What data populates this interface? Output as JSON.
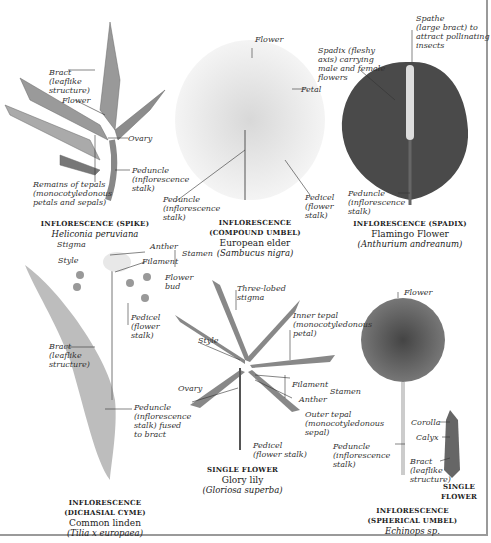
{
  "figure": {
    "panels": [
      {
        "id": "spike",
        "caption": {
          "type": "INFLORESCENCE (SPIKE)",
          "common": "",
          "scientific": "Heliconia peruviana"
        },
        "labels": [
          "Bract\n(leaflike\nstructure)",
          "Flower",
          "Ovary",
          "Peduncle\n(inflorescence\nstalk)",
          "Remains of tepals\n(monocotyledonous\npetals and sepals)"
        ]
      },
      {
        "id": "compound-umbel",
        "caption": {
          "type": "INFLORESCENCE",
          "type2": "(COMPOUND UMBEL)",
          "common": "European elder",
          "scientific": "(Sambucus nigra)"
        },
        "labels": [
          "Flower",
          "Petal",
          "Peduncle\n(inflorescence\nstalk)",
          "Pedicel\n(flower\nstalk)"
        ]
      },
      {
        "id": "spadix",
        "caption": {
          "type": "INFLORESCENCE (SPADIX)",
          "common": "Flamingo Flower",
          "scientific": "(Anthurium andreanum)"
        },
        "labels": [
          "Spathe\n(large bract) to\nattract pollinating\ninsects",
          "Spadix (fleshy\naxis) carrying\nmale and female\nflowers",
          "Peduncle\n(inflorescence\nstalk)"
        ]
      },
      {
        "id": "dichasial-cyme",
        "caption": {
          "type": "INFLORESCENCE",
          "type2": "(DICHASIAL CYME)",
          "common": "Common linden",
          "scientific": "(Tilia x europaea)"
        },
        "labels": [
          "Stigma",
          "Style",
          "Anther",
          "Filament",
          "Stamen",
          "Flower\nbud",
          "Pedicel\n(flower\nstalk)",
          "Bract\n(leaflike\nstructure)",
          "Peduncle\n(inflorescence\nstalk) fused\nto bract"
        ]
      },
      {
        "id": "single-flower",
        "caption": {
          "type": "SINGLE FLOWER",
          "common": "Glory lily",
          "scientific": "(Gloriosa superba)"
        },
        "labels": [
          "Three-lobed\nstigma",
          "Inner tepal\n(monocotyledonous\npetal)",
          "Style",
          "Ovary",
          "Filament",
          "Anther",
          "Stamen",
          "Outer tepal\n(monocotyledonous\nsepal)",
          "Pedicel\n(flower stalk)"
        ]
      },
      {
        "id": "spherical-umbel",
        "caption": {
          "type": "INFLORESCENCE",
          "type2": "(SPHERICAL UMBEL)",
          "common": "",
          "scientific": "Echinops sp."
        },
        "labels": [
          "Flower",
          "Corolla",
          "Calyx",
          "Peduncle\n(inflorescence\nstalk)",
          "Bract\n(leaflike\nstructure)"
        ],
        "inset_caption": "SINGLE\nFLOWER"
      }
    ]
  }
}
